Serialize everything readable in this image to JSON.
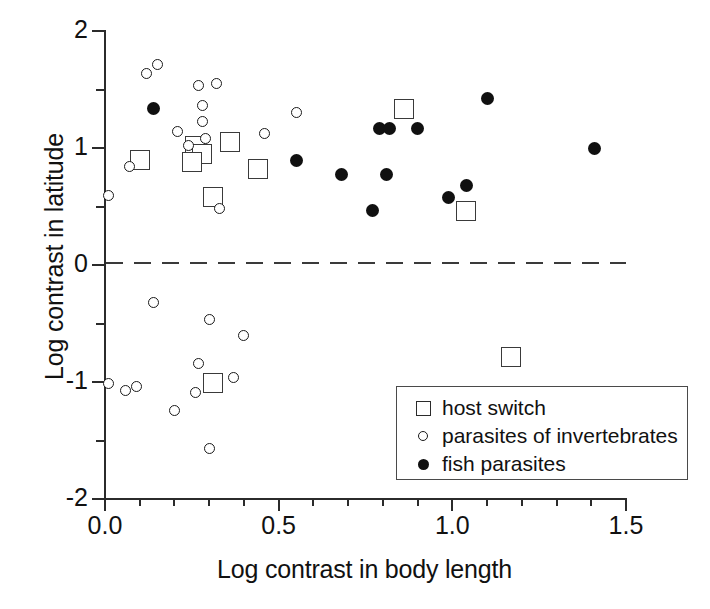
{
  "chart_data": {
    "type": "scatter",
    "title": "",
    "xlabel": "Log contrast in body length",
    "ylabel": "Log contrast in latitude",
    "xlim": [
      0.0,
      1.5
    ],
    "ylim": [
      -2,
      2
    ],
    "xticks": [
      "0.0",
      "0.5",
      "1.0",
      "1.5"
    ],
    "xtick_values": [
      0.0,
      0.5,
      1.0,
      1.5
    ],
    "xtick_minor_step": 0.1,
    "yticks": [
      "2",
      "1",
      "0",
      "-1",
      "-2"
    ],
    "ytick_values": [
      2,
      1,
      0,
      -1,
      -2
    ],
    "ytick_minor_step": 0.5,
    "grid": false,
    "reference_line": {
      "axis": "y",
      "value": 0,
      "style": "dashed"
    },
    "legend_position": "bottom-right",
    "series": [
      {
        "name": "host switch",
        "marker": "square-open",
        "points": [
          [
            0.1,
            0.9
          ],
          [
            0.26,
            1.02
          ],
          [
            0.28,
            0.95
          ],
          [
            0.25,
            0.88
          ],
          [
            0.31,
            0.58
          ],
          [
            0.36,
            1.05
          ],
          [
            0.44,
            0.82
          ],
          [
            0.86,
            1.33
          ],
          [
            1.04,
            0.46
          ],
          [
            0.31,
            -1.01
          ],
          [
            1.17,
            -0.79
          ]
        ]
      },
      {
        "name": "parasites of invertebrates",
        "marker": "circle-open",
        "points": [
          [
            0.01,
            0.59
          ],
          [
            0.07,
            0.84
          ],
          [
            0.12,
            1.64
          ],
          [
            0.15,
            1.71
          ],
          [
            0.21,
            1.14
          ],
          [
            0.24,
            1.02
          ],
          [
            0.27,
            1.53
          ],
          [
            0.32,
            1.55
          ],
          [
            0.28,
            1.36
          ],
          [
            0.28,
            1.23
          ],
          [
            0.29,
            1.08
          ],
          [
            0.33,
            0.48
          ],
          [
            0.46,
            1.12
          ],
          [
            0.55,
            1.3
          ],
          [
            0.14,
            -0.32
          ],
          [
            0.3,
            -0.47
          ],
          [
            0.4,
            -0.6
          ],
          [
            0.01,
            -1.01
          ],
          [
            0.06,
            -1.07
          ],
          [
            0.09,
            -1.04
          ],
          [
            0.27,
            -0.84
          ],
          [
            0.26,
            -1.09
          ],
          [
            0.2,
            -1.24
          ],
          [
            0.37,
            -0.96
          ],
          [
            0.3,
            -1.57
          ]
        ]
      },
      {
        "name": "fish parasites",
        "marker": "circle-filled",
        "points": [
          [
            0.14,
            1.34
          ],
          [
            0.55,
            0.89
          ],
          [
            0.68,
            0.77
          ],
          [
            0.77,
            0.47
          ],
          [
            0.79,
            1.17
          ],
          [
            0.82,
            1.17
          ],
          [
            0.81,
            0.77
          ],
          [
            0.9,
            1.17
          ],
          [
            0.99,
            0.58
          ],
          [
            1.04,
            0.68
          ],
          [
            1.1,
            1.42
          ],
          [
            1.41,
            1.0
          ]
        ]
      }
    ],
    "legend": [
      {
        "label": "host switch",
        "marker": "square-open"
      },
      {
        "label": "parasites of invertebrates",
        "marker": "circle-open"
      },
      {
        "label": "fish parasites",
        "marker": "circle-filled"
      }
    ]
  }
}
